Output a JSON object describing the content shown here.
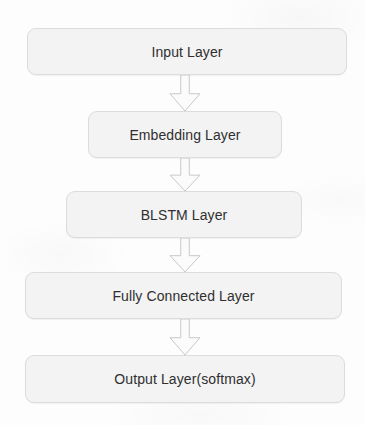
{
  "diagram": {
    "background_color": "#fdfdfd",
    "node_fill_color": "#f3f3f3",
    "node_border_color": "#dcdcdc",
    "text_color": "#2f2f2f",
    "arrow_fill_color": "#fbfbfb",
    "arrow_stroke_color": "#c8c8c8",
    "orientation": "top-to-bottom",
    "nodes": [
      {
        "id": "input-layer",
        "label": "Input Layer",
        "shape": "rounded-rectangle",
        "x": 27,
        "y": 28,
        "width": 320,
        "height": 47
      },
      {
        "id": "embedding-layer",
        "label": "Embedding Layer",
        "shape": "rounded-rectangle",
        "x": 88,
        "y": 111,
        "width": 194,
        "height": 47
      },
      {
        "id": "blstm-layer",
        "label": "BLSTM Layer",
        "shape": "rounded-rectangle",
        "x": 66,
        "y": 191,
        "width": 236,
        "height": 47
      },
      {
        "id": "fully-connected-layer",
        "label": "Fully Connected Layer",
        "shape": "rounded-rectangle",
        "x": 25,
        "y": 272,
        "width": 317,
        "height": 47
      },
      {
        "id": "output-layer",
        "label": "Output Layer(softmax)",
        "shape": "rounded-rectangle",
        "x": 25,
        "y": 355,
        "width": 320,
        "height": 48
      }
    ],
    "edges": [
      {
        "id": "edge-input-to-embedding",
        "from": "input-layer",
        "to": "embedding-layer",
        "icon": "block-arrow-down-icon",
        "x": 168,
        "y": 75,
        "width": 34,
        "height": 36
      },
      {
        "id": "edge-embedding-to-blstm",
        "from": "embedding-layer",
        "to": "blstm-layer",
        "icon": "block-arrow-down-icon",
        "x": 168,
        "y": 158,
        "width": 34,
        "height": 33
      },
      {
        "id": "edge-blstm-to-fully-connected",
        "from": "blstm-layer",
        "to": "fully-connected-layer",
        "icon": "block-arrow-down-icon",
        "x": 168,
        "y": 238,
        "width": 34,
        "height": 34
      },
      {
        "id": "edge-fully-connected-to-output",
        "from": "fully-connected-layer",
        "to": "output-layer",
        "icon": "block-arrow-down-icon",
        "x": 168,
        "y": 319,
        "width": 34,
        "height": 36
      }
    ]
  }
}
